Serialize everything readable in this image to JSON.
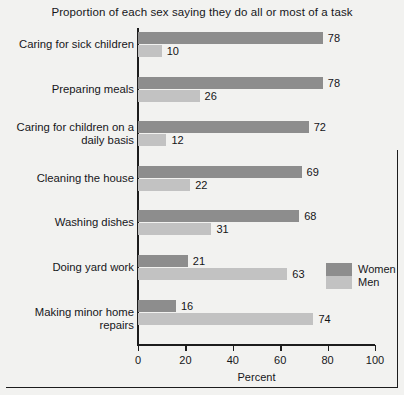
{
  "chart_data": {
    "type": "bar",
    "orientation": "horizontal",
    "title": "Proportion of each sex saying they do all or most of a task",
    "xlabel": "Percent",
    "ylabel": "",
    "xlim": [
      0,
      100
    ],
    "xticks": [
      0,
      20,
      40,
      60,
      80,
      100
    ],
    "grid": false,
    "legend_position": "right-middle",
    "categories": [
      "Caring for sick children",
      "Preparing meals",
      "Caring for children on a daily basis",
      "Cleaning the house",
      "Washing dishes",
      "Doing yard work",
      "Making minor home repairs"
    ],
    "category_lines": [
      [
        "Caring for sick children"
      ],
      [
        "Preparing meals"
      ],
      [
        "Caring for children on a",
        "daily basis"
      ],
      [
        "Cleaning the house"
      ],
      [
        "Washing dishes"
      ],
      [
        "Doing yard work"
      ],
      [
        "Making minor home repairs"
      ]
    ],
    "series": [
      {
        "name": "Women",
        "color": "#8d8d8d",
        "values": [
          78,
          78,
          72,
          69,
          68,
          21,
          16
        ]
      },
      {
        "name": "Men",
        "color": "#c2c2c2",
        "values": [
          10,
          26,
          12,
          22,
          31,
          63,
          74
        ]
      }
    ]
  },
  "legend": {
    "items": [
      {
        "label": "Women",
        "color": "#8d8d8d"
      },
      {
        "label": "Men",
        "color": "#c2c2c2"
      }
    ]
  },
  "colors": {
    "background": "#f2f2f0",
    "axis": "#1d1d1d",
    "text": "#16161a",
    "women": "#8d8d8d",
    "men": "#c2c2c2"
  }
}
